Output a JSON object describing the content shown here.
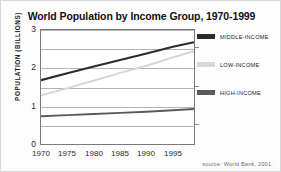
{
  "chart_data": {
    "type": "line",
    "title": "World Population by Income Group, 1970-1999",
    "xlabel": "",
    "ylabel": "POPULATION (BILLIONS)",
    "xlim": [
      1970,
      1999
    ],
    "ylim": [
      0,
      3
    ],
    "yticks": [
      "0",
      "1",
      "2",
      "3"
    ],
    "ytick_values": [
      0,
      1,
      2,
      3
    ],
    "gridlines": [
      0.5,
      1.0,
      1.5,
      2.0,
      2.5,
      3.0
    ],
    "grid": true,
    "xticks": [
      "1970",
      "1975",
      "1980",
      "1985",
      "1990",
      "1995"
    ],
    "xtick_values": [
      1970,
      1975,
      1980,
      1985,
      1990,
      1995
    ],
    "legend_position": "right",
    "x": [
      1970,
      1975,
      1980,
      1985,
      1990,
      1995,
      1999
    ],
    "series": [
      {
        "name": "MIDDLE-INCOME",
        "color": "#2b2b2b",
        "values": [
          1.68,
          1.86,
          2.04,
          2.21,
          2.38,
          2.56,
          2.68
        ]
      },
      {
        "name": "LOW-INCOME",
        "color": "#d4d4d4",
        "values": [
          1.28,
          1.47,
          1.67,
          1.87,
          2.06,
          2.28,
          2.44
        ]
      },
      {
        "name": "HIGH-INCOME",
        "color": "#5a5a5a",
        "values": [
          0.73,
          0.76,
          0.79,
          0.82,
          0.85,
          0.89,
          0.92
        ]
      }
    ],
    "source": "source: World Bank, 2001."
  }
}
